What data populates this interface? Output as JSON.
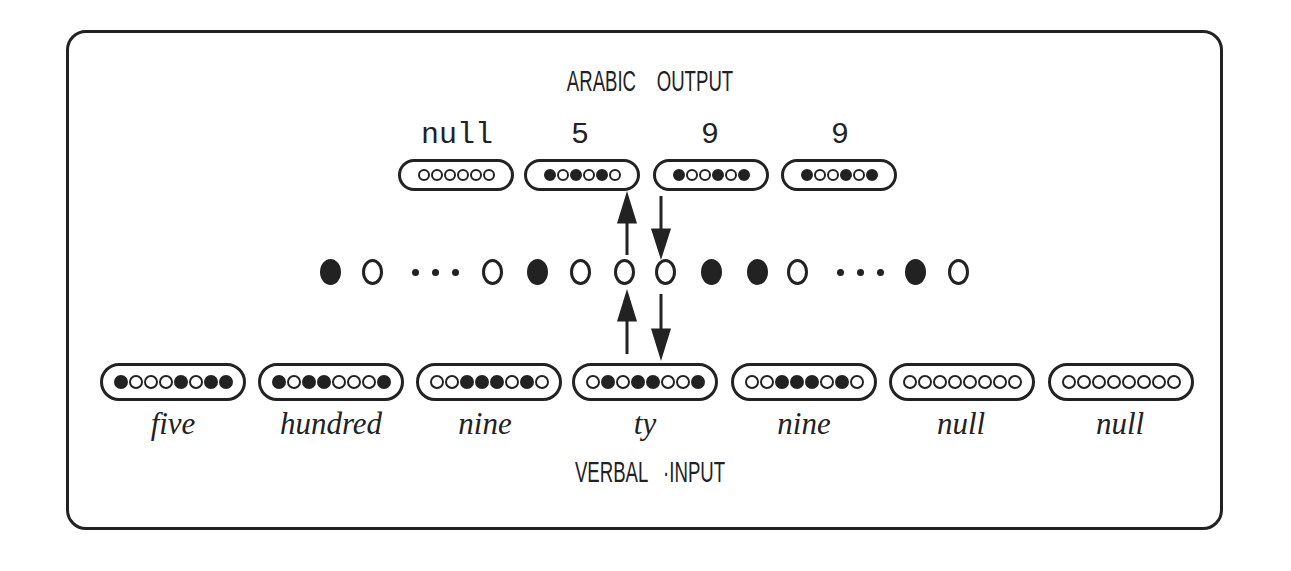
{
  "diagram": {
    "output_title": "ARABIC    OUTPUT",
    "input_title": "VERBAL   ·INPUT",
    "output_units": [
      {
        "label": "null",
        "pattern": [
          0,
          0,
          0,
          0,
          0,
          0
        ]
      },
      {
        "label": "5",
        "pattern": [
          1,
          0,
          1,
          0,
          1,
          0
        ]
      },
      {
        "label": "9",
        "pattern": [
          1,
          0,
          0,
          1,
          0,
          1
        ]
      },
      {
        "label": "9",
        "pattern": [
          1,
          0,
          0,
          1,
          0,
          1
        ]
      }
    ],
    "hidden_layer": [
      "filled",
      "open",
      "ellipsis",
      "open",
      "filled",
      "open",
      "open",
      "open",
      "filled",
      "filled",
      "open",
      "ellipsis",
      "filled",
      "open"
    ],
    "input_units": [
      {
        "label": "five",
        "pattern": [
          1,
          0,
          0,
          0,
          1,
          0,
          1,
          1
        ]
      },
      {
        "label": "hundred",
        "pattern": [
          1,
          0,
          1,
          1,
          0,
          0,
          0,
          1
        ]
      },
      {
        "label": "nine",
        "pattern": [
          0,
          0,
          1,
          1,
          1,
          0,
          1,
          0
        ]
      },
      {
        "label": "ty",
        "pattern": [
          0,
          1,
          0,
          1,
          1,
          0,
          0,
          1
        ]
      },
      {
        "label": "nine",
        "pattern": [
          0,
          0,
          1,
          1,
          1,
          0,
          1,
          0
        ]
      },
      {
        "label": "null",
        "pattern": [
          0,
          0,
          0,
          0,
          0,
          0,
          0,
          0
        ]
      },
      {
        "label": "null",
        "pattern": [
          0,
          0,
          0,
          0,
          0,
          0,
          0,
          0
        ]
      }
    ],
    "arrows": [
      {
        "direction": "up",
        "between": "input-ty -> hidden"
      },
      {
        "direction": "down",
        "between": "hidden -> input-ty"
      },
      {
        "direction": "up",
        "between": "hidden -> output-9"
      },
      {
        "direction": "down",
        "between": "output-9 -> hidden"
      }
    ]
  }
}
